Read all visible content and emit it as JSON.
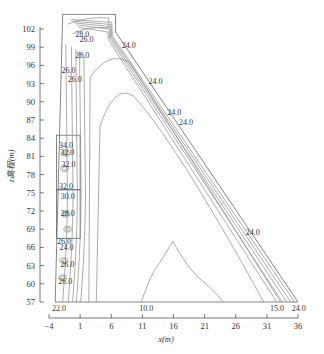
{
  "chart_data": {
    "type": "contour",
    "title": "",
    "xlabel": "x(m)",
    "ylabel": "z高程(m)",
    "xlim": [
      -4,
      36
    ],
    "ylim": [
      57,
      102
    ],
    "x_ticks": [
      -4,
      1,
      6,
      11,
      16,
      21,
      26,
      31,
      36
    ],
    "y_ticks": [
      57,
      60,
      63,
      66,
      69,
      72,
      75,
      78,
      81,
      84,
      87,
      90,
      93,
      96,
      99,
      102
    ],
    "grid": false,
    "contour_labels": [
      {
        "text": "28.0",
        "x": 0.2,
        "z": 101.2
      },
      {
        "text": "26.0",
        "x": 0.9,
        "z": 100.4
      },
      {
        "text": "24.0",
        "x": 7.7,
        "z": 99.4
      },
      {
        "text": "28.0",
        "x": 0.2,
        "z": 97.7
      },
      {
        "text": "26.0",
        "x": -2.0,
        "z": 95.2
      },
      {
        "text": "26.0",
        "x": -1.0,
        "z": 93.8
      },
      {
        "text": "24.0",
        "x": 12.0,
        "z": 93.4
      },
      {
        "text": "24.0",
        "x": 15.0,
        "z": 88.4
      },
      {
        "text": "24.0",
        "x": 16.9,
        "z": 86.6
      },
      {
        "text": "34.0",
        "x": -2.4,
        "z": 82.8
      },
      {
        "text": "32.0",
        "x": -2.2,
        "z": 81.7
      },
      {
        "text": "32.0",
        "x": -2.0,
        "z": 79.7
      },
      {
        "text": "32.0",
        "x": -2.4,
        "z": 76.1
      },
      {
        "text": "30.0",
        "x": -2.1,
        "z": 74.5
      },
      {
        "text": "28.0",
        "x": -2.1,
        "z": 71.6
      },
      {
        "text": "26.0",
        "x": -2.7,
        "z": 67.0
      },
      {
        "text": "24.0",
        "x": -2.3,
        "z": 66.0
      },
      {
        "text": "26.0",
        "x": -2.2,
        "z": 63.3
      },
      {
        "text": "26.0",
        "x": -2.5,
        "z": 60.4
      },
      {
        "text": "24.0",
        "x": 27.6,
        "z": 68.6
      },
      {
        "text": "22.0",
        "x": -3.5,
        "z": 56.0
      },
      {
        "text": "10.0",
        "x": 10.5,
        "z": 56.0
      },
      {
        "text": "15.0",
        "x": 31.5,
        "z": 56.0
      },
      {
        "text": "24.0",
        "x": 35.0,
        "z": 56.0
      }
    ],
    "dam_outline": {
      "crest_left_x": -1.8,
      "crest_right_x": 6.7,
      "crest_z": 104.4,
      "heel_x": -3.0,
      "toe_x": 36.0,
      "base_z": 57.0
    }
  }
}
